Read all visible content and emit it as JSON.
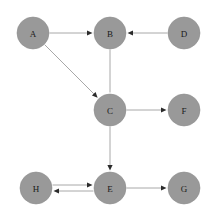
{
  "diagram": {
    "background_color": "#ffffff",
    "node_fill_color": "#999999",
    "node_stroke_color": "#8f8f8f",
    "edge_color": "#a8a8a8",
    "arrowhead_color": "#2b2b2b",
    "label_color": "#1a1a1a",
    "node_radius": 16,
    "canvas": {
      "width": 218,
      "height": 220
    }
  },
  "nodes": [
    {
      "id": "A",
      "label": "A",
      "cx": 33,
      "cy": 33
    },
    {
      "id": "B",
      "label": "B",
      "cx": 110,
      "cy": 33
    },
    {
      "id": "D",
      "label": "D",
      "cx": 184,
      "cy": 33
    },
    {
      "id": "C",
      "label": "C",
      "cx": 110,
      "cy": 110
    },
    {
      "id": "F",
      "label": "F",
      "cx": 184,
      "cy": 110
    },
    {
      "id": "H",
      "label": "H",
      "cx": 36,
      "cy": 188
    },
    {
      "id": "E",
      "label": "E",
      "cx": 110,
      "cy": 188
    },
    {
      "id": "G",
      "label": "G",
      "cx": 184,
      "cy": 188
    }
  ],
  "edges": [
    {
      "id": "A-B",
      "from": "A",
      "to": "B",
      "directed": true,
      "offset": 0
    },
    {
      "id": "A-C",
      "from": "A",
      "to": "C",
      "directed": true,
      "offset": 0
    },
    {
      "id": "D-B",
      "from": "D",
      "to": "B",
      "directed": true,
      "offset": 0
    },
    {
      "id": "B-C",
      "from": "B",
      "to": "C",
      "directed": false,
      "offset": 0
    },
    {
      "id": "C-F",
      "from": "C",
      "to": "F",
      "directed": true,
      "offset": 0
    },
    {
      "id": "C-E",
      "from": "C",
      "to": "E",
      "directed": true,
      "offset": 0
    },
    {
      "id": "H-E",
      "from": "H",
      "to": "E",
      "directed": true,
      "offset": -3
    },
    {
      "id": "E-H",
      "from": "E",
      "to": "H",
      "directed": true,
      "offset": -3
    },
    {
      "id": "E-G",
      "from": "E",
      "to": "G",
      "directed": true,
      "offset": 0
    }
  ]
}
